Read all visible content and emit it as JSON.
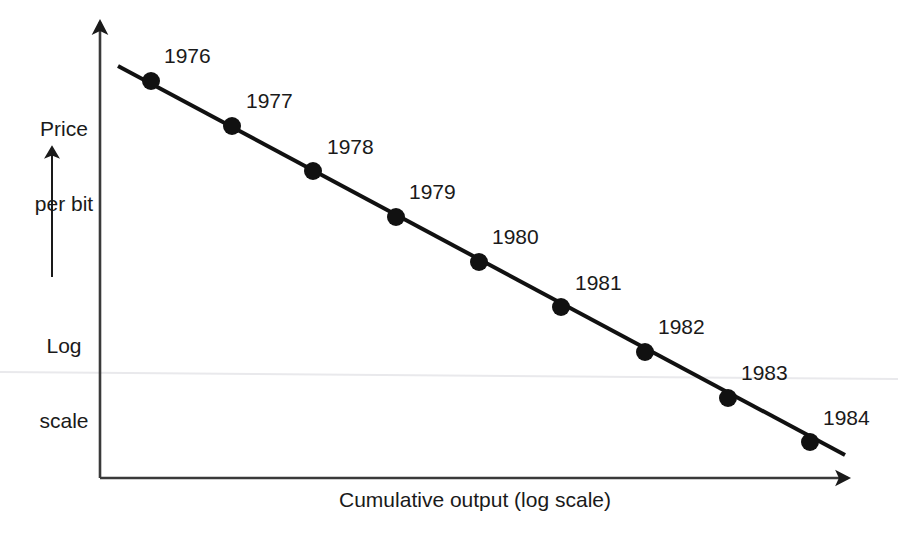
{
  "chart_data": {
    "type": "line",
    "title": "",
    "subtitle": "",
    "xlabel": "Cumulative output (log scale)",
    "ylabel": "Price per bit",
    "ylabel_note": "Log scale",
    "ylabel_line1": "Price",
    "ylabel_line2": "per bit",
    "ylabel_note_line1": "Log",
    "ylabel_note_line2": "scale",
    "grid": false,
    "legend": "none",
    "axis_scale_x": "log",
    "axis_scale_y": "log",
    "x_axis_has_arrow": true,
    "y_axis_has_arrow": true,
    "series_name": "Price per bit vs cumulative output",
    "categories": [
      "1976",
      "1977",
      "1978",
      "1979",
      "1980",
      "1981",
      "1982",
      "1983",
      "1984"
    ],
    "annotations": [
      "1976",
      "1977",
      "1978",
      "1979",
      "1980",
      "1981",
      "1982",
      "1983",
      "1984"
    ],
    "points": [
      {
        "label": "1976",
        "px": 151,
        "py": 81,
        "label_x": 164,
        "label_y": 45
      },
      {
        "label": "1977",
        "px": 232,
        "py": 126,
        "label_x": 246,
        "label_y": 90
      },
      {
        "label": "1978",
        "px": 313,
        "py": 171,
        "label_x": 327,
        "label_y": 136
      },
      {
        "label": "1979",
        "px": 396,
        "py": 217,
        "label_x": 409,
        "label_y": 181
      },
      {
        "label": "1980",
        "px": 479,
        "py": 262,
        "label_x": 492,
        "label_y": 226
      },
      {
        "label": "1981",
        "px": 561,
        "py": 307,
        "label_x": 575,
        "label_y": 272
      },
      {
        "label": "1982",
        "px": 645,
        "py": 352,
        "label_x": 658,
        "label_y": 316
      },
      {
        "label": "1983",
        "px": 728,
        "py": 398,
        "label_x": 741,
        "label_y": 362
      },
      {
        "label": "1984",
        "px": 810,
        "py": 442,
        "label_x": 823,
        "label_y": 407
      }
    ],
    "values_relative_log": [
      1.0,
      0.855,
      0.711,
      0.566,
      0.421,
      0.277,
      0.132,
      -0.013,
      -0.155
    ],
    "trend_line": {
      "x1": 118,
      "y1": 66,
      "x2": 845,
      "y2": 455
    },
    "marker_style": "filled-circle",
    "marker_radius": 9,
    "marker_color": "#111111",
    "line_color": "#111111",
    "line_width": 4
  },
  "axes": {
    "y_axis": {
      "x": 100,
      "y_top": 14,
      "y_bottom": 478
    },
    "x_axis": {
      "y": 478,
      "x_left": 100,
      "x_right": 858
    }
  },
  "y_direction_arrow": {
    "x": 52,
    "y_top": 140,
    "y_bottom": 277
  }
}
